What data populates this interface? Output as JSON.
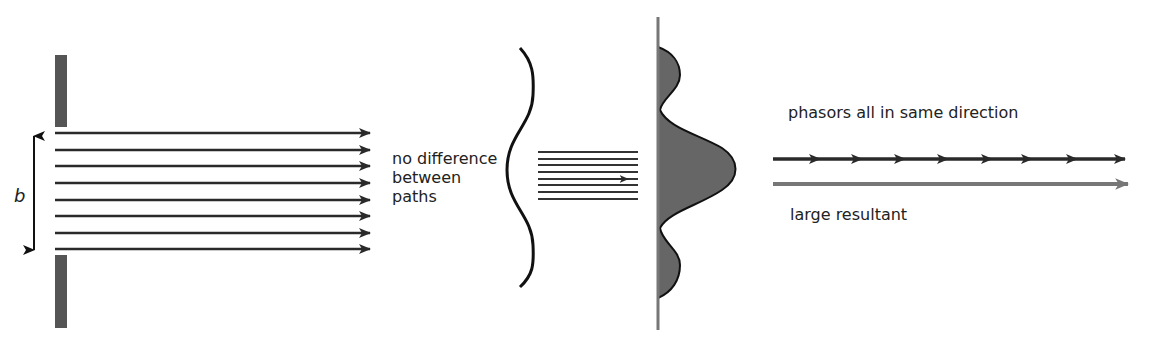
{
  "diagram": {
    "colors": {
      "ink": "#2a2a2a",
      "barrier": "#555555",
      "fill": "#666666",
      "resultant": "#777777",
      "text": "#222222"
    },
    "slit": {
      "width_label": "b",
      "ray_count": 8
    },
    "brace_label": "no difference\nbetween\npaths",
    "screen": {
      "pattern": "intensity profile with central maximum and two side lobes"
    },
    "phasors": {
      "label": "phasors all in same direction",
      "count": 8
    },
    "resultant": {
      "label": "large resultant"
    }
  }
}
